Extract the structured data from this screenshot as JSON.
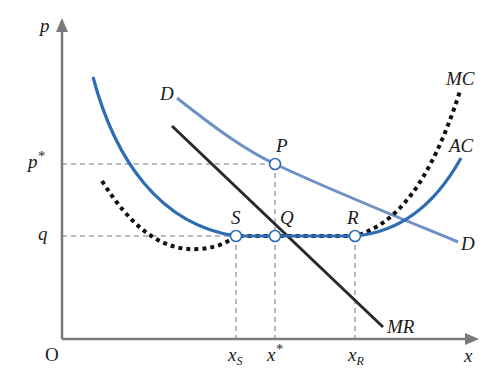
{
  "diagram": {
    "title": "",
    "axes": {
      "x_label": "x",
      "y_label": "p",
      "origin_label": "O"
    },
    "y_ticks": [
      {
        "label": "p*",
        "base": "p",
        "sup": "*"
      },
      {
        "label": "q",
        "base": "q",
        "sup": ""
      }
    ],
    "x_ticks": [
      {
        "label": "x_S",
        "base": "x",
        "sub": "S"
      },
      {
        "label": "x*",
        "base": "x",
        "sup": "*"
      },
      {
        "label": "x_R",
        "base": "x",
        "sub": "R"
      }
    ],
    "curves": [
      {
        "name": "D",
        "label_start": "D",
        "label_end": "D",
        "color": "#6f90c6",
        "style": "solid"
      },
      {
        "name": "MR",
        "label": "MR",
        "color": "#2a2a2a",
        "style": "solid"
      },
      {
        "name": "AC",
        "label": "AC",
        "color": "#2e6db4",
        "style": "solid"
      },
      {
        "name": "MC",
        "label": "MC",
        "color": "#111111",
        "style": "dotted"
      }
    ],
    "points": [
      {
        "label": "P"
      },
      {
        "label": "S"
      },
      {
        "label": "Q"
      },
      {
        "label": "R"
      }
    ],
    "colors": {
      "axis": "#777777",
      "guide": "#777777",
      "demand": "#6f90c6",
      "ac": "#2e6db4",
      "mc": "#111111",
      "mr": "#2a2a2a"
    }
  }
}
